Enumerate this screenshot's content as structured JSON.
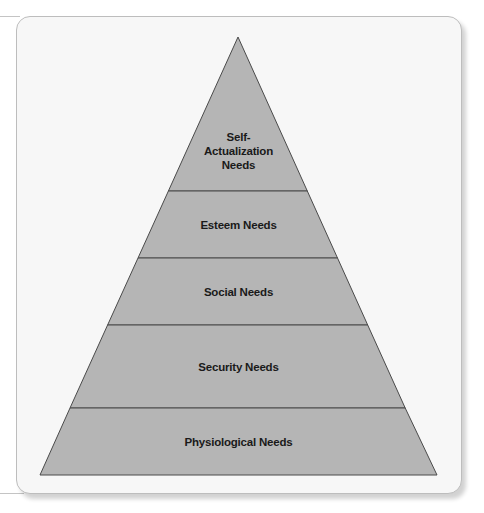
{
  "diagram": {
    "type": "pyramid",
    "title": "",
    "colors": {
      "card_background": "#f7f7f7",
      "card_border": "#bdbdbd",
      "pyramid_fill": "#b5b5b5",
      "pyramid_stroke": "#4a4a4a",
      "label_color": "#1a1a1a"
    },
    "levels": [
      {
        "order": 1,
        "label_lines": [
          "Self-",
          "Actualization",
          "Needs"
        ]
      },
      {
        "order": 2,
        "label": "Esteem Needs"
      },
      {
        "order": 3,
        "label": "Social Needs"
      },
      {
        "order": 4,
        "label": "Security Needs"
      },
      {
        "order": 5,
        "label": "Physiological Needs"
      }
    ]
  }
}
